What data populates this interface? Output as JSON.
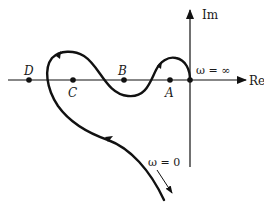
{
  "diagram": {
    "axes": {
      "real_label": "Re",
      "imag_label": "Im"
    },
    "points": [
      {
        "id": "D",
        "label": "D"
      },
      {
        "id": "C",
        "label": "C"
      },
      {
        "id": "B",
        "label": "B"
      },
      {
        "id": "A",
        "label": "A"
      }
    ],
    "annotations": {
      "omega_infinity": "ω = ∞",
      "omega_zero": "ω = 0"
    },
    "colors": {
      "stroke": "#111111",
      "background": "#ffffff"
    }
  }
}
